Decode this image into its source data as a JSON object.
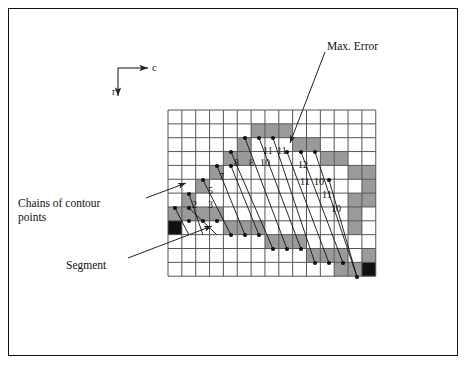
{
  "figure": {
    "background": "#ffffff",
    "frame_color": "#111111"
  },
  "axes": {
    "c_label": "c",
    "r_label": "r",
    "origin_x": 118,
    "origin_y": 68
  },
  "annotations": [
    {
      "name": "max-error",
      "text": "Max. Error",
      "x": 327,
      "y": 40,
      "leader": {
        "x1": 325,
        "y1": 52,
        "x2": 290,
        "y2": 143
      }
    },
    {
      "name": "chains-of-contour-points",
      "text": "Chains of contour",
      "text2": "points",
      "x": 18,
      "y": 196,
      "leader": {
        "x1": 146,
        "y1": 198,
        "x2": 186,
        "y2": 183
      }
    },
    {
      "name": "segment",
      "text": "Segment",
      "x": 66,
      "y": 259,
      "leader": {
        "x1": 128,
        "y1": 258,
        "x2": 212,
        "y2": 226
      }
    }
  ],
  "grid": {
    "x0": 168,
    "y0": 110,
    "cell": 13.85,
    "cols": 15,
    "rows": 12,
    "line_color": "#555555",
    "gray_color": "#9a9a9a",
    "black_color": "#111111"
  },
  "grid_cells": {
    "gray": [
      [
        6,
        1
      ],
      [
        7,
        1
      ],
      [
        8,
        1
      ],
      [
        5,
        2
      ],
      [
        9,
        2
      ],
      [
        10,
        2
      ],
      [
        4,
        3
      ],
      [
        5,
        3
      ],
      [
        11,
        3
      ],
      [
        12,
        3
      ],
      [
        3,
        4
      ],
      [
        13,
        4
      ],
      [
        14,
        4
      ],
      [
        2,
        5
      ],
      [
        14,
        5
      ],
      [
        1,
        6
      ],
      [
        13,
        6
      ],
      [
        14,
        6
      ],
      [
        0,
        7
      ],
      [
        1,
        7
      ],
      [
        2,
        7
      ],
      [
        3,
        7
      ],
      [
        13,
        7
      ],
      [
        4,
        8
      ],
      [
        5,
        8
      ],
      [
        6,
        8
      ],
      [
        13,
        8
      ],
      [
        7,
        9
      ],
      [
        8,
        9
      ],
      [
        9,
        9
      ],
      [
        10,
        10
      ],
      [
        11,
        10
      ],
      [
        12,
        10
      ],
      [
        14,
        10
      ],
      [
        12,
        11
      ],
      [
        13,
        11
      ]
    ],
    "black": [
      [
        0,
        8
      ],
      [
        14,
        11
      ]
    ]
  },
  "chain_points": [
    {
      "x": 175,
      "y": 208
    },
    {
      "x": 189,
      "y": 221
    },
    {
      "x": 203,
      "y": 221
    },
    {
      "x": 217,
      "y": 221
    },
    {
      "x": 189,
      "y": 194
    },
    {
      "x": 189,
      "y": 208
    },
    {
      "x": 203,
      "y": 180
    },
    {
      "x": 217,
      "y": 166
    },
    {
      "x": 231,
      "y": 166
    },
    {
      "x": 231,
      "y": 152
    },
    {
      "x": 245,
      "y": 138
    },
    {
      "x": 259,
      "y": 138
    },
    {
      "x": 273,
      "y": 138
    },
    {
      "x": 287,
      "y": 152
    },
    {
      "x": 301,
      "y": 152
    },
    {
      "x": 315,
      "y": 152
    },
    {
      "x": 329,
      "y": 180
    },
    {
      "x": 231,
      "y": 235
    },
    {
      "x": 245,
      "y": 235
    },
    {
      "x": 259,
      "y": 235
    },
    {
      "x": 273,
      "y": 249
    },
    {
      "x": 287,
      "y": 249
    },
    {
      "x": 301,
      "y": 249
    },
    {
      "x": 315,
      "y": 263
    },
    {
      "x": 329,
      "y": 263
    },
    {
      "x": 343,
      "y": 263
    },
    {
      "x": 357,
      "y": 277
    }
  ],
  "cell_numbers": [
    {
      "value": "2",
      "x": 192,
      "y": 200
    },
    {
      "value": "3",
      "x": 208,
      "y": 200
    },
    {
      "value": "5",
      "x": 208,
      "y": 186
    },
    {
      "value": "7",
      "x": 219,
      "y": 172
    },
    {
      "value": "8",
      "x": 234,
      "y": 158
    },
    {
      "value": "8",
      "x": 249,
      "y": 158
    },
    {
      "value": "10",
      "x": 260,
      "y": 158
    },
    {
      "value": "11",
      "x": 263,
      "y": 146
    },
    {
      "value": "11",
      "x": 277,
      "y": 146
    },
    {
      "value": "12",
      "x": 298,
      "y": 160
    },
    {
      "value": "11",
      "x": 300,
      "y": 177
    },
    {
      "value": "10",
      "x": 314,
      "y": 177
    },
    {
      "value": "11",
      "x": 322,
      "y": 190
    },
    {
      "value": "10",
      "x": 331,
      "y": 204
    }
  ],
  "chain_lines": [
    {
      "x1": 175,
      "y1": 208,
      "x2": 189,
      "y2": 235
    },
    {
      "x1": 189,
      "y1": 194,
      "x2": 203,
      "y2": 235
    },
    {
      "x1": 189,
      "y1": 208,
      "x2": 217,
      "y2": 235
    },
    {
      "x1": 203,
      "y1": 180,
      "x2": 231,
      "y2": 235
    },
    {
      "x1": 217,
      "y1": 166,
      "x2": 245,
      "y2": 235
    },
    {
      "x1": 231,
      "y1": 166,
      "x2": 259,
      "y2": 235
    },
    {
      "x1": 231,
      "y1": 152,
      "x2": 273,
      "y2": 249
    },
    {
      "x1": 245,
      "y1": 138,
      "x2": 287,
      "y2": 249
    },
    {
      "x1": 259,
      "y1": 138,
      "x2": 301,
      "y2": 249
    },
    {
      "x1": 273,
      "y1": 138,
      "x2": 315,
      "y2": 263
    },
    {
      "x1": 287,
      "y1": 152,
      "x2": 329,
      "y2": 263
    },
    {
      "x1": 301,
      "y1": 152,
      "x2": 343,
      "y2": 263
    },
    {
      "x1": 315,
      "y1": 152,
      "x2": 357,
      "y2": 277
    },
    {
      "x1": 329,
      "y1": 180,
      "x2": 357,
      "y2": 277
    }
  ]
}
